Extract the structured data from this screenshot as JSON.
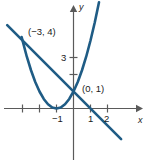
{
  "chart_data": {
    "type": "line",
    "title": "",
    "xlabel": "x",
    "ylabel": "y",
    "xlim": [
      -3.9,
      3.0
    ],
    "ylim": [
      -1.7,
      6.3
    ],
    "grid": false,
    "legend": "none",
    "x_ticks": [
      {
        "value": -3,
        "label": ""
      },
      {
        "value": -2,
        "label": ""
      },
      {
        "value": -1,
        "label": "−1"
      },
      {
        "value": 1,
        "label": "1"
      },
      {
        "value": 2,
        "label": "2"
      }
    ],
    "y_ticks": [
      {
        "value": 2,
        "label": ""
      },
      {
        "value": 3,
        "label": "3"
      }
    ],
    "series": [
      {
        "name": "parabola",
        "type": "curve",
        "equation": "y = (x + 1)^2",
        "color": "#1f5c85",
        "x": [
          -3.05,
          -2.75,
          -2.5,
          -2.25,
          -2,
          -1.75,
          -1.5,
          -1.25,
          -1,
          -0.75,
          -0.5,
          -0.25,
          0,
          0.25,
          0.5,
          0.75,
          1,
          1.25,
          1.5
        ],
        "y": [
          4.2,
          3.06,
          2.25,
          1.56,
          1.0,
          0.56,
          0.25,
          0.06,
          0,
          0.06,
          0.25,
          0.56,
          1.0,
          1.56,
          2.25,
          3.06,
          4.0,
          5.06,
          6.25
        ]
      },
      {
        "name": "line",
        "type": "line",
        "equation": "y = -x + 1",
        "color": "#1f5c85",
        "x": [
          -3.9,
          2.8
        ],
        "y": [
          4.9,
          -1.8
        ]
      }
    ],
    "annotations": [
      {
        "name": "intersection-upper",
        "label": "(−3, 4)",
        "x": -3,
        "y": 4
      },
      {
        "name": "intersection-lower",
        "label": "(0, 1)",
        "x": 0,
        "y": 1
      }
    ],
    "axis_color": "#5a5a5a",
    "curve_color": "#1f5c85",
    "background": "#ffffff"
  },
  "labels": {
    "x_axis_name": "x",
    "y_axis_name": "y",
    "tick_neg_one": "−1",
    "tick_one": "1",
    "tick_two": "2",
    "tick_three": "3",
    "point_a": "(−3, 4)",
    "point_b": "(0, 1)"
  }
}
